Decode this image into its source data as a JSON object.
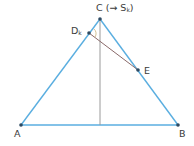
{
  "diagram": {
    "colors": {
      "triangle": "#5aaee0",
      "altitude": "#9a9a9a",
      "segment_de": "#8a6a6a",
      "point": "#2e4a62",
      "label": "#3a3a3a",
      "angle_mark": "#c8b27a"
    },
    "points": {
      "A": {
        "x": 21,
        "y": 125
      },
      "B": {
        "x": 178,
        "y": 125
      },
      "C": {
        "x": 100,
        "y": 19
      },
      "D": {
        "x": 89,
        "y": 33
      },
      "E": {
        "x": 138,
        "y": 70
      },
      "H": {
        "x": 100,
        "y": 125
      }
    },
    "labels": {
      "A": "A",
      "B": "B",
      "C_main": "C (→ S",
      "C_sub": "k",
      "C_close": ")",
      "D_main": "D",
      "D_sub": "k",
      "E": "E"
    }
  }
}
